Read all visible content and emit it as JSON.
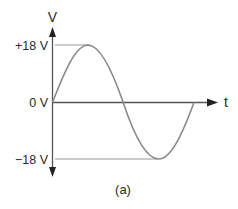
{
  "diagram": {
    "type": "sine-wave-voltage-plot",
    "caption": "(a)",
    "axes": {
      "y_label": "V",
      "x_label": "t"
    },
    "levels": [
      {
        "label": "+18 V",
        "value": 18
      },
      {
        "label": "0 V",
        "value": 0
      },
      {
        "label": "−18 V",
        "value": -18
      }
    ],
    "waveform": {
      "shape": "sine",
      "peak_voltage": 18,
      "cycles": 1
    },
    "colors": {
      "axis": "#2a2a2a",
      "waveform": "#8a8a8a",
      "reference_lines": "#9a9a9a",
      "text": "#2a2a2a"
    }
  }
}
